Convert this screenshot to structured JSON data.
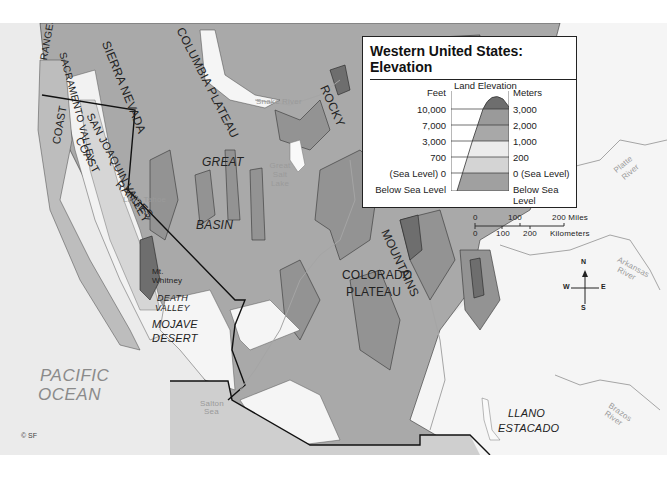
{
  "map": {
    "title_line1": "Western United States:",
    "title_line2": "Elevation",
    "colors": {
      "below_sea_level": "#a0a0a0",
      "sea_level_0_to_200m": "#d4d4d4",
      "200_to_1000m": "#e9e9e9",
      "1000_to_2000m": "#a8a8a8",
      "2000_to_3000m": "#8a8a8a",
      "above_3000m": "#6e6e6e",
      "ocean": "#ebebeb",
      "land_lowest": "#f7f7f7"
    },
    "legend": {
      "left_header": "Feet",
      "center_header": "Land Elevation",
      "right_header": "Meters",
      "rows": [
        {
          "feet": "10,000",
          "meters": "3,000"
        },
        {
          "feet": "7,000",
          "meters": "2,000"
        },
        {
          "feet": "3,000",
          "meters": "1,000"
        },
        {
          "feet": "700",
          "meters": "200"
        },
        {
          "feet": "(Sea Level) 0",
          "meters": "0 (Sea Level)"
        },
        {
          "feet": "Below Sea Level",
          "meters": "Below Sea Level"
        }
      ]
    },
    "scale_bar": {
      "miles_labels": [
        "0",
        "100",
        "200 Miles"
      ],
      "km_labels": [
        "0",
        "100",
        "200",
        "Kilometers"
      ]
    },
    "compass": {
      "n": "N",
      "s": "S",
      "e": "E",
      "w": "W"
    },
    "labels": {
      "coast_ranges_north": "RANGES",
      "coast_north": "COAST",
      "sacramento_valley": "SACRAMENTO VALLEY",
      "sierra_nevada": "SIERRA NEVADA",
      "san_joaquin_valley": "SAN JOAQUIN VALLEY",
      "coast_south": "COAST",
      "ranges_south": "RANGES",
      "columbia_plateau": "COLUMBIA PLATEAU",
      "rocky": "ROCKY",
      "mountains": "MOUNTAINS",
      "great": "GREAT",
      "basin": "BASIN",
      "great_salt_lake": "Great Salt Lake",
      "lake_tahoe": "Lake Tahoe",
      "mt_whitney": "Mt. Whitney",
      "death_valley_1": "DEATH",
      "death_valley_2": "VALLEY",
      "mojave_1": "MOJAVE",
      "mojave_2": "DESERT",
      "colorado_1": "COLORADO",
      "colorado_2": "PLATEAU",
      "llano_1": "LLANO",
      "llano_2": "ESTACADO",
      "pacific_1": "PACIFIC",
      "pacific_2": "OCEAN",
      "snake_river": "Snake River",
      "platte_river_1": "Platte",
      "platte_river_2": "River",
      "arkansas_river_1": "Arkansas",
      "arkansas_river_2": "River",
      "brazos_river_1": "Brazos",
      "brazos_river_2": "River",
      "salton_sea_1": "Salton",
      "salton_sea_2": "Sea",
      "green_river": "Green River",
      "colorado_river": "Colorado River",
      "rio_grande": "Rio Grande"
    },
    "copyright": "© SF"
  }
}
